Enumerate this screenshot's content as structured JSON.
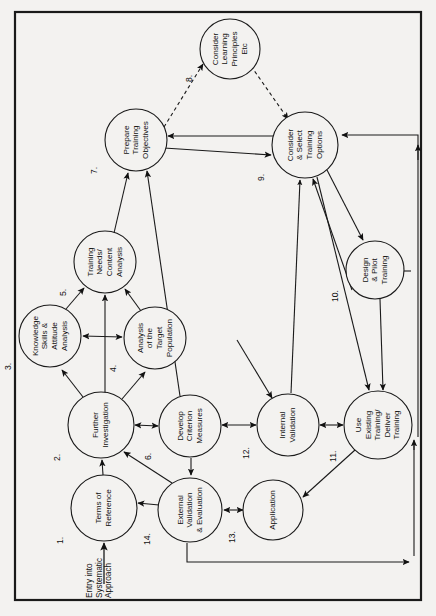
{
  "figure": {
    "orientation": "rotated-90-clockwise",
    "frame_color": "#1a1a1a",
    "background_color": "#f3f2f0",
    "line_color": "#1a1a1a",
    "entry_label": "Entry into\nSystematic\nApproach",
    "entry_label_lines": [
      "Entry into",
      "Systematic",
      "Approach"
    ]
  },
  "chart_data": {
    "type": "diagram",
    "nodes": [
      {
        "id": 1,
        "number": "1.",
        "label": "Terms of\nReference",
        "lines": [
          "Terms of",
          "Reference"
        ],
        "cx": 104,
        "cy": 508,
        "r": 33
      },
      {
        "id": 2,
        "number": "2.",
        "label": "Further\nInvestigation",
        "lines": [
          "Further",
          "Investigation"
        ],
        "cx": 101,
        "cy": 425,
        "r": 33
      },
      {
        "id": 3,
        "number": "3.",
        "label": "Knowledge\nSkills &\nAttitude\nAnalysis",
        "lines": [
          "Knowledge",
          "Skills &",
          "Attitude",
          "Analysis"
        ],
        "cx": 50,
        "cy": 336,
        "r": 31
      },
      {
        "id": 4,
        "number": "4.",
        "label": "Analysis\nof the\nTarget\nPopulation",
        "lines": [
          "Analysis",
          "of the",
          "Target",
          "Population"
        ],
        "cx": 155,
        "cy": 338,
        "r": 31
      },
      {
        "id": 5,
        "number": "5.",
        "label": "Training\nNeeds/\nContent\nAnalysis",
        "lines": [
          "Training",
          "Needs/",
          "Content",
          "Analysis"
        ],
        "cx": 105,
        "cy": 262,
        "r": 31
      },
      {
        "id": 6,
        "number": "6.",
        "label": "Develop\nCriterion\nMeasures",
        "lines": [
          "Develop",
          "Criterion",
          "Measures"
        ],
        "cx": 190,
        "cy": 426,
        "r": 31
      },
      {
        "id": 7,
        "number": "7.",
        "label": "Prepare\nTraining\nObjectives",
        "lines": [
          "Prepare",
          "Training",
          "Objectives"
        ],
        "cx": 136,
        "cy": 140,
        "r": 31
      },
      {
        "id": 8,
        "number": "8.",
        "label": "Consider\nLearning\nPrinciples\nEtc",
        "lines": [
          "Consider",
          "Learning",
          "Principles",
          "Etc"
        ],
        "cx": 230,
        "cy": 49,
        "r": 30
      },
      {
        "id": 9,
        "number": "9.",
        "label": "Consider\n& Select\nTraining\nOptions",
        "lines": [
          "Consider",
          "& Select",
          "Training",
          "Options"
        ],
        "cx": 305,
        "cy": 145,
        "r": 33
      },
      {
        "id": 10,
        "number": "10.",
        "label": "Design\n& Pilot\nTraining",
        "lines": [
          "Design",
          "& Pilot",
          "Training"
        ],
        "cx": 375,
        "cy": 270,
        "r": 29
      },
      {
        "id": 11,
        "number": "11.",
        "label": "Use\nExisting\nTraining/\nDeliver\nTraining",
        "lines": [
          "Use",
          "Existing",
          "Training/",
          "Deliver",
          "Training"
        ],
        "cx": 378,
        "cy": 425,
        "r": 34
      },
      {
        "id": 12,
        "number": "12.",
        "label": "Internal\nValidation",
        "lines": [
          "Internal",
          "Validation"
        ],
        "cx": 288,
        "cy": 425,
        "r": 31
      },
      {
        "id": 13,
        "number": "13.",
        "label": "Application",
        "lines": [
          "Application"
        ],
        "cx": 273,
        "cy": 510,
        "r": 30
      },
      {
        "id": 14,
        "number": "14.",
        "label": "External\nValidation\n& Evaluation",
        "lines": [
          "External",
          "Validation",
          "& Evaluation"
        ],
        "cx": 190,
        "cy": 510,
        "r": 32
      }
    ],
    "edges": [
      {
        "from": "entry",
        "to": 1,
        "style": "solid",
        "arrow": "single"
      },
      {
        "from": 1,
        "to": 2,
        "style": "solid",
        "arrow": "single"
      },
      {
        "from": 2,
        "to": 3,
        "style": "solid",
        "arrow": "single"
      },
      {
        "from": 2,
        "to": 4,
        "style": "solid",
        "arrow": "single"
      },
      {
        "from": 3,
        "to": 4,
        "style": "solid",
        "arrow": "double"
      },
      {
        "from": 3,
        "to": 5,
        "style": "solid",
        "arrow": "single"
      },
      {
        "from": 4,
        "to": 5,
        "style": "solid",
        "arrow": "single"
      },
      {
        "from": 2,
        "to": 5,
        "style": "solid",
        "arrow": "single"
      },
      {
        "from": 2,
        "to": 6,
        "style": "solid",
        "arrow": "double"
      },
      {
        "from": 5,
        "to": 7,
        "style": "solid",
        "arrow": "single"
      },
      {
        "from": 6,
        "to": 7,
        "style": "solid",
        "arrow": "single"
      },
      {
        "from": 7,
        "to": 8,
        "style": "dashed",
        "arrow": "single"
      },
      {
        "from": 8,
        "to": 9,
        "style": "dashed",
        "arrow": "single"
      },
      {
        "from": 7,
        "to": 9,
        "style": "solid",
        "arrow": "single"
      },
      {
        "from": 9,
        "to": 7,
        "style": "solid",
        "arrow": "single"
      },
      {
        "from": 9,
        "to": 10,
        "style": "solid",
        "arrow": "single"
      },
      {
        "from": 9,
        "to": 11,
        "style": "solid",
        "arrow": "single"
      },
      {
        "from": 10,
        "to": 11,
        "style": "solid",
        "arrow": "single"
      },
      {
        "from": 10,
        "to": 9,
        "style": "solid",
        "arrow": "single"
      },
      {
        "from": 12,
        "to": 11,
        "style": "solid",
        "arrow": "double"
      },
      {
        "from": 12,
        "to": 6,
        "style": "solid",
        "arrow": "double"
      },
      {
        "from": 12,
        "to": 9,
        "style": "solid",
        "arrow": "single"
      },
      {
        "from": 6,
        "to": 14,
        "style": "solid",
        "arrow": "single"
      },
      {
        "from": 11,
        "to": 13,
        "style": "solid",
        "arrow": "single"
      },
      {
        "from": 13,
        "to": 14,
        "style": "solid",
        "arrow": "double"
      },
      {
        "from": 14,
        "to": 1,
        "style": "solid",
        "arrow": "single"
      },
      {
        "from": 14,
        "to": 2,
        "style": "solid",
        "arrow": "single"
      },
      {
        "from": 14,
        "to": 11,
        "style": "solid",
        "arrow": "single",
        "routing": "bottom-right-loop"
      },
      {
        "from": 11,
        "to": 9,
        "style": "solid",
        "arrow": "single",
        "routing": "right-top-loop"
      }
    ]
  }
}
